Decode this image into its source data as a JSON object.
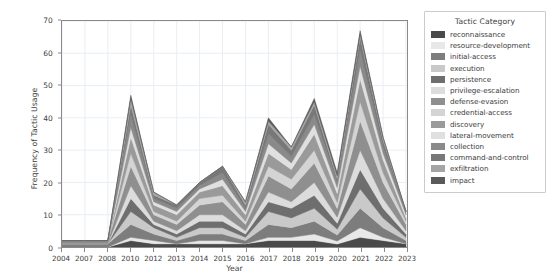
{
  "chart_data": {
    "type": "area",
    "title": "",
    "xlabel": "Year",
    "ylabel": "Frequency of Tactic Usage",
    "ylim": [
      0,
      70
    ],
    "yticks": [
      0,
      10,
      20,
      30,
      40,
      50,
      60,
      70
    ],
    "grid": true,
    "stacked": true,
    "legend_position": "right-outside",
    "legend_title": "Tactic Category",
    "categories": [
      "2004",
      "2007",
      "2008",
      "2010",
      "2012",
      "2013",
      "2014",
      "2015",
      "2016",
      "2017",
      "2018",
      "2019",
      "2020",
      "2021",
      "2022",
      "2023"
    ],
    "totals": [
      2,
      2,
      2,
      47,
      17,
      13,
      20,
      25,
      14,
      40,
      31,
      46,
      23,
      67,
      34,
      11
    ],
    "series": [
      {
        "name": "reconnaissance",
        "color": "#4a4a4a",
        "values": [
          0,
          0,
          0,
          2,
          1,
          1,
          1,
          1,
          1,
          2,
          2,
          2,
          1,
          3,
          2,
          1
        ]
      },
      {
        "name": "resource-development",
        "color": "#e8e8e8",
        "values": [
          0,
          0,
          0,
          1,
          1,
          0,
          1,
          1,
          0,
          1,
          1,
          2,
          1,
          3,
          1,
          0
        ]
      },
      {
        "name": "initial-access",
        "color": "#7d7d7d",
        "values": [
          1,
          1,
          1,
          4,
          2,
          1,
          2,
          2,
          1,
          4,
          3,
          4,
          2,
          6,
          3,
          1
        ]
      },
      {
        "name": "execution",
        "color": "#c9c9c9",
        "values": [
          0,
          0,
          0,
          4,
          2,
          1,
          2,
          2,
          1,
          4,
          3,
          4,
          2,
          6,
          3,
          1
        ]
      },
      {
        "name": "persistence",
        "color": "#6e6e6e",
        "values": [
          0,
          0,
          0,
          4,
          1,
          1,
          2,
          2,
          1,
          3,
          3,
          4,
          2,
          6,
          3,
          1
        ]
      },
      {
        "name": "privilege-escalation",
        "color": "#dcdcdc",
        "values": [
          0,
          0,
          0,
          4,
          1,
          1,
          2,
          2,
          1,
          3,
          2,
          4,
          2,
          6,
          3,
          1
        ]
      },
      {
        "name": "defense-evasion",
        "color": "#8f8f8f",
        "values": [
          1,
          1,
          1,
          6,
          2,
          2,
          3,
          4,
          2,
          5,
          4,
          6,
          3,
          9,
          5,
          2
        ]
      },
      {
        "name": "credential-access",
        "color": "#d4d4d4",
        "values": [
          0,
          0,
          0,
          4,
          1,
          1,
          2,
          2,
          1,
          3,
          3,
          4,
          2,
          6,
          3,
          1
        ]
      },
      {
        "name": "discovery",
        "color": "#9a9a9a",
        "values": [
          0,
          0,
          0,
          5,
          2,
          2,
          2,
          3,
          2,
          4,
          3,
          5,
          3,
          7,
          4,
          1
        ]
      },
      {
        "name": "lateral-movement",
        "color": "#e0e0e0",
        "values": [
          0,
          0,
          0,
          3,
          1,
          1,
          1,
          2,
          1,
          3,
          2,
          3,
          2,
          4,
          2,
          1
        ]
      },
      {
        "name": "collection",
        "color": "#8a8a8a",
        "values": [
          0,
          0,
          0,
          4,
          1,
          1,
          1,
          2,
          1,
          3,
          2,
          3,
          2,
          5,
          2,
          1
        ]
      },
      {
        "name": "command-and-control",
        "color": "#787878",
        "values": [
          0,
          0,
          0,
          3,
          1,
          1,
          1,
          2,
          1,
          3,
          2,
          3,
          1,
          4,
          2,
          0
        ]
      },
      {
        "name": "exfiltration",
        "color": "#a5a5a5",
        "values": [
          0,
          0,
          0,
          2,
          1,
          0,
          0,
          0,
          1,
          1,
          1,
          1,
          1,
          1,
          1,
          0
        ]
      },
      {
        "name": "impact",
        "color": "#5a5a5a",
        "values": [
          0,
          0,
          0,
          1,
          0,
          0,
          0,
          0,
          0,
          1,
          0,
          1,
          1,
          1,
          0,
          0
        ]
      }
    ]
  },
  "axes": {
    "ylabel": "Frequency of Tactic Usage",
    "xlabel": "Year"
  },
  "legend": {
    "title": "Tactic Category"
  },
  "colors": {
    "axis": "#8a8a8a",
    "grid": "#e9eef4",
    "text": "#3c3c3c",
    "background": "#ffffff"
  }
}
